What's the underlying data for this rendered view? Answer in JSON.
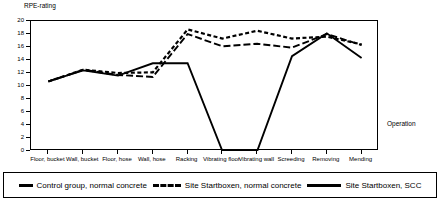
{
  "chart_data": {
    "type": "line",
    "title": "",
    "ylabel": "RPE-rating",
    "xlabel": "Operation",
    "ylim": [
      0,
      20
    ],
    "yticks": [
      0,
      2,
      4,
      6,
      8,
      10,
      12,
      14,
      16,
      18,
      20
    ],
    "grid": false,
    "legend_position": "bottom",
    "categories": [
      "Floor, bucket",
      "Wall, bucket",
      "Floor, hose",
      "Wall, hose",
      "Racking",
      "Vibrating floor",
      "Vibrating wall",
      "Screeding",
      "Removing",
      "Mending"
    ],
    "series": [
      {
        "name": "Control group, normal concrete",
        "style": "dashed",
        "values": [
          10.7,
          12.5,
          11.7,
          11.4,
          18.0,
          16.1,
          16.5,
          15.9,
          18.0,
          16.3
        ]
      },
      {
        "name": "Site Startboxen, normal concrete",
        "style": "dotted",
        "values": [
          10.7,
          12.5,
          12.0,
          12.1,
          18.7,
          17.3,
          18.5,
          17.3,
          17.6,
          16.4
        ]
      },
      {
        "name": "Site Startboxen, SCC",
        "style": "solid",
        "values": [
          10.7,
          12.4,
          11.6,
          13.5,
          13.5,
          0.0,
          0.0,
          14.6,
          18.1,
          14.3
        ]
      }
    ]
  },
  "legend": {
    "items": [
      {
        "label": "Control group, normal concrete",
        "swatch": "dash-swatch"
      },
      {
        "label": "Site Startboxen, normal concrete",
        "swatch": "dotted-swatch"
      },
      {
        "label": "Site Startboxen, SCC",
        "swatch": "solid-swatch"
      }
    ]
  }
}
